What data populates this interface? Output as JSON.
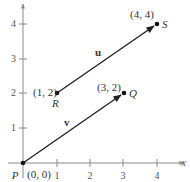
{
  "diagram": {
    "type": "coordinate-vectors",
    "axes": {
      "x_label": "x",
      "x_ticks": [
        "1",
        "2",
        "3",
        "4"
      ],
      "y_ticks": [
        "1",
        "2",
        "3",
        "4"
      ]
    },
    "points": {
      "P": {
        "name": "P",
        "coords": "(0, 0)",
        "x": 0,
        "y": 0
      },
      "Q": {
        "name": "Q",
        "coords": "(3, 2)",
        "x": 3,
        "y": 2
      },
      "R": {
        "name": "R",
        "coords": "(1, 2)",
        "x": 1,
        "y": 2
      },
      "S": {
        "name": "S",
        "coords": "(4, 4)",
        "x": 4,
        "y": 4
      }
    },
    "vectors": {
      "u": {
        "label": "u",
        "from": "R",
        "to": "S"
      },
      "v": {
        "label": "v",
        "from": "P",
        "to": "Q"
      }
    },
    "colors": {
      "axis": "#8a8a8a",
      "vector": "#222222",
      "text": "#333333"
    }
  }
}
